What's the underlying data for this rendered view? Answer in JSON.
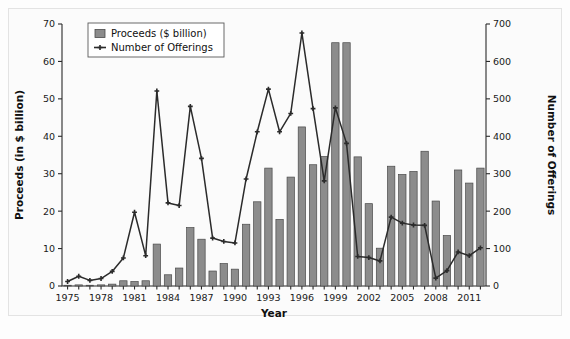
{
  "chart_data": {
    "type": "bar",
    "title": "",
    "subtitle": "",
    "xlabel": "Year",
    "ylabel": "Proceeds (in $ billion)",
    "y2label": "Number of Offerings",
    "ylim": [
      0,
      70
    ],
    "y2lim": [
      0,
      700
    ],
    "xlim": [
      1975,
      2012
    ],
    "grid": false,
    "legend_position": "top-left",
    "y_ticks": [
      0,
      10,
      20,
      30,
      40,
      50,
      60,
      70
    ],
    "y2_ticks": [
      0,
      100,
      200,
      300,
      400,
      500,
      600,
      700
    ],
    "x_ticks": [
      1975,
      1978,
      1981,
      1984,
      1987,
      1990,
      1993,
      1996,
      1999,
      2002,
      2005,
      2008,
      2011
    ],
    "x": [
      1975,
      1976,
      1977,
      1978,
      1979,
      1980,
      1981,
      1982,
      1983,
      1984,
      1985,
      1986,
      1987,
      1988,
      1989,
      1990,
      1991,
      1992,
      1993,
      1994,
      1995,
      1996,
      1997,
      1998,
      1999,
      2000,
      2001,
      2002,
      2003,
      2004,
      2005,
      2006,
      2007,
      2008,
      2009,
      2010,
      2011,
      2012
    ],
    "series": [
      {
        "name": "Proceeds ($ billion)",
        "axis": "left",
        "render": "bar",
        "color": "#8c8c8c",
        "values": [
          0.2,
          0.3,
          0.2,
          0.3,
          0.5,
          1.4,
          1.2,
          1.4,
          11.2,
          3.0,
          4.8,
          15.6,
          12.5,
          4.0,
          6.0,
          4.5,
          16.5,
          22.5,
          31.5,
          17.8,
          29.1,
          42.5,
          32.4,
          34.6,
          65.0,
          65.0,
          34.5,
          22.0,
          10.1,
          32.0,
          29.8,
          30.6,
          36.0,
          22.7,
          13.5,
          31.0,
          27.5,
          31.5
        ]
      },
      {
        "name": "Number of Offerings",
        "axis": "right",
        "render": "line",
        "color": "#2b2b2b",
        "marker": "cross",
        "values": [
          12,
          26,
          15,
          20,
          39,
          75,
          197,
          81,
          521,
          222,
          215,
          480,
          341,
          128,
          119,
          115,
          286,
          412,
          526,
          412,
          461,
          676,
          474,
          281,
          476,
          381,
          79,
          76,
          67,
          184,
          168,
          163,
          162,
          21,
          41,
          91,
          81,
          102
        ]
      }
    ]
  }
}
